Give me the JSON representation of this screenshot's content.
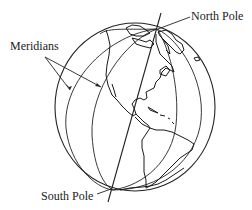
{
  "diagram": {
    "labels": {
      "north_pole": "North Pole",
      "south_pole": "South Pole",
      "meridians": "Meridians"
    },
    "elements": {
      "globe_outline": "circle",
      "axis": "line through poles",
      "meridian_count_visible": 4,
      "continents_shown": [
        "North America",
        "Central America",
        "South America",
        "Greenland"
      ]
    },
    "colors": {
      "line": "#222222",
      "background": "#ffffff"
    }
  }
}
